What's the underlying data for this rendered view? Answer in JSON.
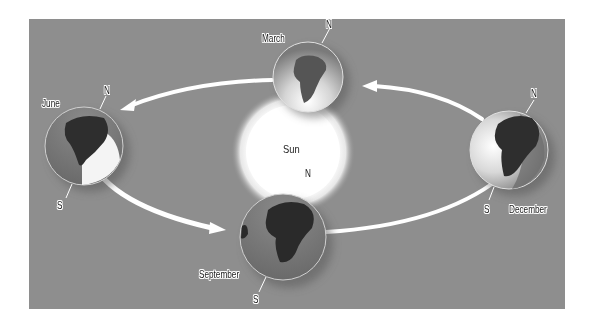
{
  "figure": {
    "sun": {
      "label": "Sun"
    },
    "positions": [
      {
        "month": "March",
        "north": "N"
      },
      {
        "month": "June",
        "north": "N",
        "south": "S"
      },
      {
        "month": "September",
        "north": "N",
        "south": "S"
      },
      {
        "month": "December",
        "north": "N",
        "south": "S"
      }
    ],
    "colors": {
      "background": "#8e8e8e",
      "sun": "#ffffff",
      "ocean": "#7a7a7a",
      "land": "#2a2a2a",
      "arrow": "#ffffff"
    }
  }
}
